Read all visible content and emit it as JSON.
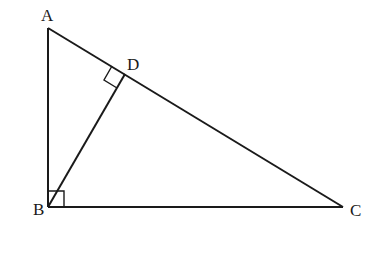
{
  "diagram": {
    "type": "geometry",
    "stroke_color": "#1a1a1a",
    "points": {
      "A": {
        "label": "A",
        "x": 48,
        "y": 28
      },
      "B": {
        "label": "B",
        "x": 48,
        "y": 207
      },
      "C": {
        "label": "C",
        "x": 343,
        "y": 207
      },
      "D": {
        "label": "D",
        "x": 125,
        "y": 74
      }
    },
    "segments": [
      [
        "A",
        "B"
      ],
      [
        "B",
        "C"
      ],
      [
        "A",
        "C"
      ],
      [
        "B",
        "D"
      ]
    ],
    "right_angles": [
      "B",
      "D"
    ]
  }
}
